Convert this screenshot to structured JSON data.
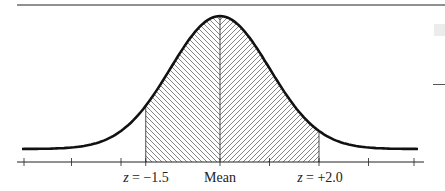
{
  "chart_data": {
    "type": "area",
    "title": "",
    "distribution": "normal",
    "mean": 0,
    "sd": 1,
    "shaded_region": {
      "from_z": -1.5,
      "to_z": 2.0
    },
    "hatch": {
      "left_of_mean": "backslash",
      "right_of_mean": "forward-slash"
    },
    "x_tick_positions_z": [
      -4,
      -3,
      -2,
      -1.5,
      0,
      1,
      2,
      3,
      4
    ],
    "xlabels": [
      {
        "z": -1.5,
        "text": "z = −1.5"
      },
      {
        "z": 0,
        "text": "Mean"
      },
      {
        "z": 2.0,
        "text": "z = +2.0"
      }
    ],
    "xlabel": "",
    "ylabel": ""
  },
  "labels": {
    "left_var": "z",
    "left_val": " = −1.5",
    "mean": "Mean",
    "right_var": "z",
    "right_val": " = +2.0"
  }
}
